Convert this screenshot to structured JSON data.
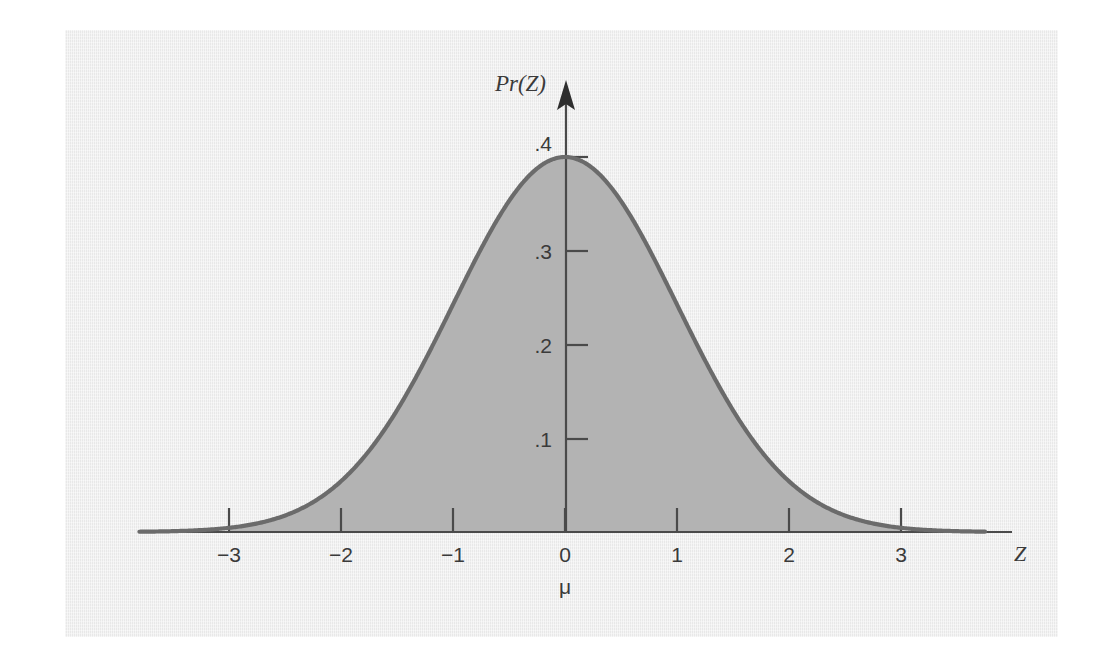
{
  "figure": {
    "panel_background": "#eeeeee",
    "page_background": "#ffffff",
    "curve_color": "#6b6b6b",
    "fill_color": "#b3b3b3",
    "axis_color": "#4a4a4a",
    "text_color": "#3a3a3a"
  },
  "labels": {
    "y_axis_title": "Pr(Z)",
    "x_axis_title": "Z",
    "mean_marker": "μ"
  },
  "chart_data": {
    "type": "area",
    "title": "",
    "subtitle": "",
    "xlabel": "Z",
    "ylabel": "Pr(Z)",
    "xlim": [
      -3.8,
      4.0
    ],
    "ylim": [
      0,
      0.43
    ],
    "grid": false,
    "legend": null,
    "x_ticks": [
      -3,
      -2,
      -1,
      0,
      1,
      2,
      3
    ],
    "x_tick_labels": [
      "−3",
      "−2",
      "−1",
      "0",
      "1",
      "2",
      "3"
    ],
    "y_ticks": [
      0.1,
      0.2,
      0.3,
      0.4
    ],
    "y_tick_labels": [
      ".1",
      ".2",
      ".3",
      ".4"
    ],
    "annotations": [
      {
        "text": "μ",
        "x": 0,
        "y": 0,
        "note": "population mean marked below the zero tick"
      }
    ],
    "shaded_region": {
      "from": -3,
      "to": 3,
      "note": "area under the standard normal curve between z = -3 and z = 3"
    },
    "series": [
      {
        "name": "Standard normal density",
        "distribution": "normal",
        "mean": 0,
        "sd": 1,
        "peak_value": 0.3989,
        "x": [
          -3.8,
          -3.6,
          -3.4,
          -3.2,
          -3.0,
          -2.8,
          -2.6,
          -2.4,
          -2.2,
          -2.0,
          -1.8,
          -1.6,
          -1.4,
          -1.2,
          -1.0,
          -0.8,
          -0.6,
          -0.4,
          -0.2,
          0.0,
          0.2,
          0.4,
          0.6,
          0.8,
          1.0,
          1.2,
          1.4,
          1.6,
          1.8,
          2.0,
          2.2,
          2.4,
          2.6,
          2.8,
          3.0,
          3.2,
          3.4,
          3.6,
          3.8
        ],
        "values": [
          0.0003,
          0.0006,
          0.0012,
          0.0024,
          0.0044,
          0.0079,
          0.0136,
          0.0224,
          0.0355,
          0.054,
          0.079,
          0.1109,
          0.1497,
          0.1942,
          0.242,
          0.2897,
          0.3332,
          0.3683,
          0.391,
          0.3989,
          0.391,
          0.3683,
          0.3332,
          0.2897,
          0.242,
          0.1942,
          0.1497,
          0.1109,
          0.079,
          0.054,
          0.0355,
          0.0224,
          0.0136,
          0.0079,
          0.0044,
          0.0024,
          0.0012,
          0.0006,
          0.0003
        ]
      }
    ]
  }
}
